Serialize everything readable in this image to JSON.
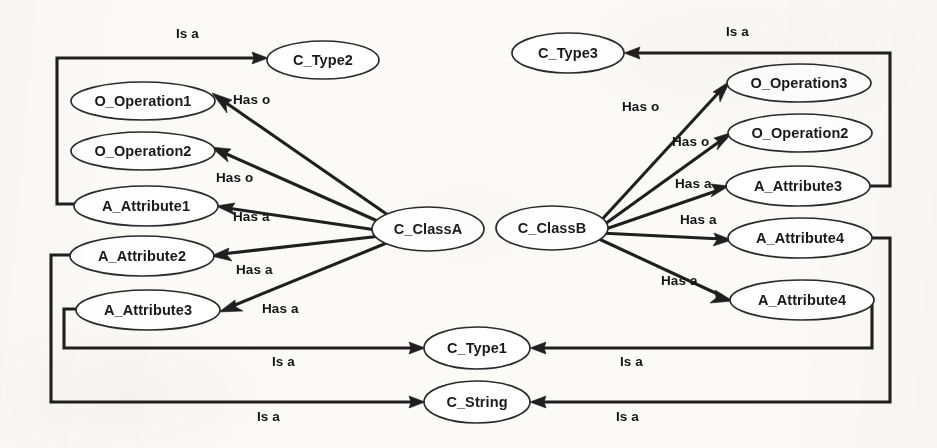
{
  "diagram": {
    "type": "directed-graph",
    "background_color": "#fbfaf7",
    "stroke_color": "#1f1f1f",
    "node_fill": "#ffffff",
    "nodes": [
      {
        "id": "c_type2",
        "label": "C_Type2",
        "cx": 323,
        "cy": 60,
        "rx": 56,
        "ry": 19
      },
      {
        "id": "o_operation1",
        "label": "O_Operation1",
        "cx": 143,
        "cy": 101,
        "rx": 72,
        "ry": 19
      },
      {
        "id": "o_operation2",
        "label": "O_Operation2",
        "cx": 143,
        "cy": 151,
        "rx": 72,
        "ry": 19
      },
      {
        "id": "a_attribute1",
        "label": "A_Attribute1",
        "cx": 146,
        "cy": 206,
        "rx": 72,
        "ry": 20
      },
      {
        "id": "a_attribute2",
        "label": "A_Attribute2",
        "cx": 142,
        "cy": 256,
        "rx": 72,
        "ry": 20
      },
      {
        "id": "a_attribute3_left",
        "label": "A_Attribute3",
        "cx": 148,
        "cy": 310,
        "rx": 72,
        "ry": 20
      },
      {
        "id": "c_classa",
        "label": "C_ClassA",
        "cx": 428,
        "cy": 229,
        "rx": 56,
        "ry": 22
      },
      {
        "id": "c_classb",
        "label": "C_ClassB",
        "cx": 552,
        "cy": 228,
        "rx": 56,
        "ry": 22
      },
      {
        "id": "c_type3",
        "label": "C_Type3",
        "cx": 568,
        "cy": 53,
        "rx": 56,
        "ry": 20
      },
      {
        "id": "o_operation3",
        "label": "O_Operation3",
        "cx": 799,
        "cy": 83,
        "rx": 72,
        "ry": 19
      },
      {
        "id": "o_operation2_r",
        "label": "O_Operation2",
        "cx": 800,
        "cy": 133,
        "rx": 72,
        "ry": 19
      },
      {
        "id": "a_attribute3_right",
        "label": "A_Attribute3",
        "cx": 798,
        "cy": 186,
        "rx": 72,
        "ry": 20
      },
      {
        "id": "a_attribute4_a",
        "label": "A_Attribute4",
        "cx": 800,
        "cy": 238,
        "rx": 72,
        "ry": 20
      },
      {
        "id": "a_attribute4_b",
        "label": "A_Attribute4",
        "cx": 802,
        "cy": 300,
        "rx": 72,
        "ry": 20
      },
      {
        "id": "c_type1",
        "label": "C_Type1",
        "cx": 477,
        "cy": 348,
        "rx": 53,
        "ry": 21
      },
      {
        "id": "c_string",
        "label": "C_String",
        "cx": 477,
        "cy": 402,
        "rx": 53,
        "ry": 21
      }
    ],
    "edges": [
      {
        "id": "e1",
        "from": "a_attribute1",
        "to": "c_type2",
        "label": "Is a",
        "label_x": 176,
        "label_y": 38
      },
      {
        "id": "e2",
        "from": "c_classa",
        "to": "o_operation1",
        "label": "Has o",
        "label_x": 233,
        "label_y": 104
      },
      {
        "id": "e3",
        "from": "c_classa",
        "to": "o_operation2",
        "label": "Has o",
        "label_x": 216,
        "label_y": 182
      },
      {
        "id": "e4",
        "from": "c_classa",
        "to": "a_attribute1",
        "label": "Has a",
        "label_x": 233,
        "label_y": 221
      },
      {
        "id": "e5",
        "from": "c_classa",
        "to": "a_attribute2",
        "label": "Has a",
        "label_x": 236,
        "label_y": 274
      },
      {
        "id": "e6",
        "from": "c_classa",
        "to": "a_attribute3_left",
        "label": "Has a",
        "label_x": 262,
        "label_y": 313
      },
      {
        "id": "e7",
        "from": "a_attribute3_left",
        "to": "c_type1",
        "label": "Is a",
        "label_x": 272,
        "label_y": 366
      },
      {
        "id": "e8",
        "from": "a_attribute2",
        "to": "c_string",
        "label": "Is a",
        "label_x": 257,
        "label_y": 421
      },
      {
        "id": "e9",
        "from": "c_classb",
        "to": "o_operation3",
        "label": "Has o",
        "label_x": 622,
        "label_y": 111
      },
      {
        "id": "e10",
        "from": "c_classb",
        "to": "o_operation2_r",
        "label": "Has o",
        "label_x": 672,
        "label_y": 146
      },
      {
        "id": "e11",
        "from": "c_classb",
        "to": "a_attribute3_right",
        "label": "Has a",
        "label_x": 675,
        "label_y": 188
      },
      {
        "id": "e12",
        "from": "c_classb",
        "to": "a_attribute4_a",
        "label": "Has a",
        "label_x": 680,
        "label_y": 224
      },
      {
        "id": "e13",
        "from": "c_classb",
        "to": "a_attribute4_b",
        "label": "Has a",
        "label_x": 661,
        "label_y": 285
      },
      {
        "id": "e14",
        "from": "a_attribute3_right",
        "to": "c_type3",
        "label": "Is a",
        "label_x": 726,
        "label_y": 36
      },
      {
        "id": "e15",
        "from": "a_attribute4_b",
        "to": "c_type1",
        "label": "Is a",
        "label_x": 620,
        "label_y": 366
      },
      {
        "id": "e16",
        "from": "a_attribute4_a",
        "to": "c_string",
        "label": "Is a",
        "label_x": 616,
        "label_y": 421
      }
    ],
    "relation_types": [
      "Is a",
      "Has o",
      "Has a"
    ]
  }
}
